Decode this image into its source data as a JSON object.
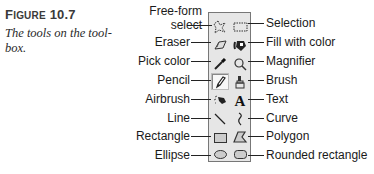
{
  "caption": {
    "figure_prefix": "F",
    "figure_smallcaps": "IGURE",
    "figure_number": "10.7",
    "description_line1": "The tools on the tool-",
    "description_line2": "box."
  },
  "tools": [
    {
      "name": "Free-form select",
      "label_line1": "Free-form",
      "label_line2": "select",
      "icon": "free-form-select-icon",
      "side": "left"
    },
    {
      "name": "Selection",
      "label": "Selection",
      "icon": "selection-icon",
      "side": "right"
    },
    {
      "name": "Eraser",
      "label": "Eraser",
      "icon": "eraser-icon",
      "side": "left"
    },
    {
      "name": "Fill with color",
      "label": "Fill with color",
      "icon": "fill-bucket-icon",
      "side": "right"
    },
    {
      "name": "Pick color",
      "label": "Pick color",
      "icon": "eyedropper-icon",
      "side": "left"
    },
    {
      "name": "Magnifier",
      "label": "Magnifier",
      "icon": "magnifier-icon",
      "side": "right"
    },
    {
      "name": "Pencil",
      "label": "Pencil",
      "icon": "pencil-icon",
      "side": "left",
      "selected": true
    },
    {
      "name": "Brush",
      "label": "Brush",
      "icon": "brush-icon",
      "side": "right"
    },
    {
      "name": "Airbrush",
      "label": "Airbrush",
      "icon": "airbrush-icon",
      "side": "left"
    },
    {
      "name": "Text",
      "label": "Text",
      "icon": "text-icon",
      "glyph": "A",
      "side": "right"
    },
    {
      "name": "Line",
      "label": "Line",
      "icon": "line-icon",
      "side": "left"
    },
    {
      "name": "Curve",
      "label": "Curve",
      "icon": "curve-icon",
      "side": "right"
    },
    {
      "name": "Rectangle",
      "label": "Rectangle",
      "icon": "rectangle-icon",
      "side": "left"
    },
    {
      "name": "Polygon",
      "label": "Polygon",
      "icon": "polygon-icon",
      "side": "right"
    },
    {
      "name": "Ellipse",
      "label": "Ellipse",
      "icon": "ellipse-icon",
      "side": "left"
    },
    {
      "name": "Rounded rectangle",
      "label": "Rounded rectangle",
      "icon": "rounded-rectangle-icon",
      "side": "right"
    }
  ]
}
